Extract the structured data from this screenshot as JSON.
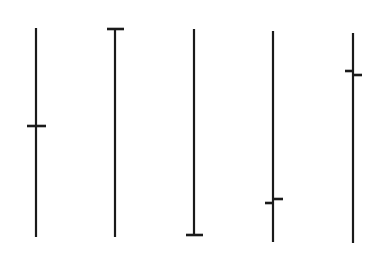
{
  "diagram": {
    "stroke_color": "#1a1a1a",
    "background": "#ffffff",
    "candles": [
      {
        "name": "doji-standard",
        "x": 36,
        "high": 28,
        "low": 237,
        "open": 126,
        "close": 126,
        "tick_left": 27,
        "tick_right": 46
      },
      {
        "name": "doji-gravestone-inverted-dragonfly",
        "x": 115,
        "high": 29,
        "low": 237,
        "open": 29,
        "close": 29,
        "tick_left": 107,
        "tick_right": 124
      },
      {
        "name": "doji-gravestone",
        "x": 194,
        "high": 29,
        "low": 235,
        "open": 235,
        "close": 235,
        "tick_left": 186,
        "tick_right": 203
      },
      {
        "name": "low-open-close",
        "x": 273,
        "high": 31,
        "low": 242,
        "open": 203,
        "close": 199,
        "tick_left": 265,
        "tick_right": 283
      },
      {
        "name": "high-open-close",
        "x": 353,
        "high": 33,
        "low": 243,
        "open": 71,
        "close": 75,
        "tick_left": 345,
        "tick_right": 362
      }
    ]
  }
}
